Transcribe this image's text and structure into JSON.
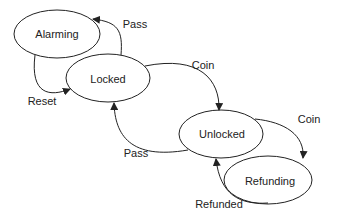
{
  "diagram": {
    "type": "state-machine",
    "states": [
      {
        "id": "alarming",
        "label": "Alarming",
        "cx": 57,
        "cy": 34,
        "rx": 43,
        "ry": 24
      },
      {
        "id": "locked",
        "label": "Locked",
        "cx": 108,
        "cy": 78,
        "rx": 42,
        "ry": 24
      },
      {
        "id": "unlocked",
        "label": "Unlocked",
        "cx": 221,
        "cy": 134,
        "rx": 42,
        "ry": 24
      },
      {
        "id": "refunding",
        "label": "Refunding",
        "cx": 268,
        "cy": 180,
        "rx": 44,
        "ry": 24
      }
    ],
    "transitions": [
      {
        "from": "locked",
        "to": "alarming",
        "label": "Pass"
      },
      {
        "from": "alarming",
        "to": "locked",
        "label": "Reset"
      },
      {
        "from": "locked",
        "to": "unlocked",
        "label": "Coin"
      },
      {
        "from": "unlocked",
        "to": "locked",
        "label": "Pass"
      },
      {
        "from": "unlocked",
        "to": "refunding",
        "label": "Coin"
      },
      {
        "from": "refunding",
        "to": "unlocked",
        "label": "Refunded"
      }
    ],
    "colors": {
      "stroke": "#222222",
      "background": "#ffffff"
    }
  }
}
